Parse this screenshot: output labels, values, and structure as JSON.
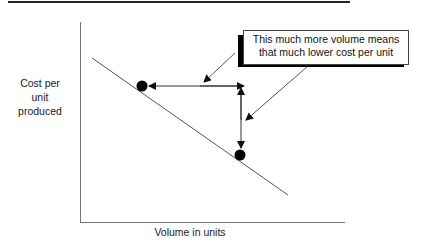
{
  "diagram": {
    "y_axis_label": [
      "Cost per",
      "unit",
      "produced"
    ],
    "x_axis_label": "Volume in units",
    "callout": {
      "lines": [
        "This much more volume means",
        "that much lower cost per unit"
      ]
    },
    "points": [
      {
        "name": "low-volume-point",
        "x": 142,
        "y": 86
      },
      {
        "name": "high-volume-point",
        "x": 240,
        "y": 155
      }
    ],
    "colors": {
      "line": "#555555",
      "marker": "#000000",
      "axis": "#777777"
    }
  }
}
